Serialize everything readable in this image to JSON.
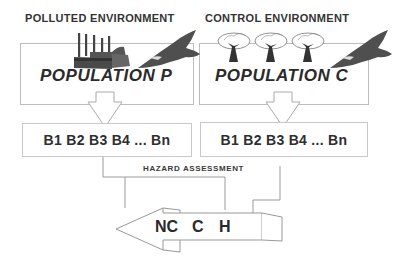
{
  "diagram": {
    "environments": [
      {
        "title": "POLLUTED ENVIRONMENT",
        "population_label": "POPULATION P",
        "icons": [
          "factory-icon",
          "bird-of-prey-icon"
        ],
        "biomarkers": "B1 B2 B3 B4 ... Bn"
      },
      {
        "title": "CONTROL ENVIRONMENT",
        "population_label": "POPULATION C",
        "icons": [
          "tree-icon",
          "tree-icon",
          "tree-icon",
          "bird-of-prey-icon"
        ],
        "biomarkers": "B1 B2 B3 B4 ... Bn"
      }
    ],
    "assessment_label": "HAZARD ASSESSMENT",
    "outcomes": [
      "NC",
      "C",
      "H"
    ],
    "colors": {
      "text": "#2b2b2b",
      "box_border": "#bdbdbd",
      "icon_fill": "#555555",
      "line": "#9a9a9a"
    }
  }
}
